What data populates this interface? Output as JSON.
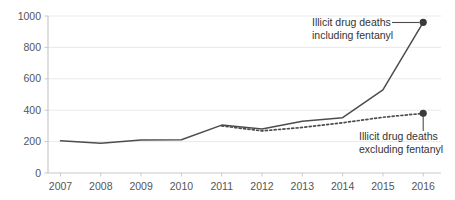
{
  "chart_data": {
    "type": "line",
    "title": "",
    "subtitle": "",
    "xlabel": "",
    "ylabel": "",
    "categories": [
      "2007",
      "2008",
      "2009",
      "2010",
      "2011",
      "2012",
      "2013",
      "2014",
      "2015",
      "2016"
    ],
    "x": [
      2007,
      2008,
      2009,
      2010,
      2011,
      2012,
      2013,
      2014,
      2015,
      2016
    ],
    "xlim": [
      2007,
      2016
    ],
    "ylim": [
      0,
      1000
    ],
    "yticks": [
      0,
      200,
      400,
      600,
      800,
      1000
    ],
    "ytick_labels": [
      "0",
      "200",
      "400",
      "600",
      "800",
      "1000"
    ],
    "xtick_labels": [
      "2007",
      "2008",
      "2009",
      "2010",
      "2011",
      "2012",
      "2013",
      "2014",
      "2015",
      "2016"
    ],
    "grid": true,
    "grid_axis": "y",
    "legend": "annotations",
    "series": [
      {
        "name": "Illicit drug deaths including fentanyl",
        "style": "solid",
        "color": "#4d4d4d",
        "values": [
          205,
          190,
          210,
          212,
          305,
          280,
          330,
          352,
          530,
          960
        ],
        "endpoint_marker": true
      },
      {
        "name": "Illicit drug deaths excluding fentanyl",
        "style": "dotted",
        "color": "#4d4d4d",
        "values": [
          null,
          null,
          null,
          null,
          300,
          268,
          290,
          320,
          355,
          380
        ],
        "endpoint_marker": true
      }
    ],
    "annotations": [
      {
        "id": "annotation-including-fentanyl",
        "line1": "Illicit drug deaths",
        "line2": "including fentanyl",
        "points_to": {
          "x": 2016,
          "y": 960
        }
      },
      {
        "id": "annotation-excluding-fentanyl",
        "line1": "Illicit drug deaths",
        "line2": "excluding fentanyl",
        "points_to": {
          "x": 2016,
          "y": 380
        }
      }
    ],
    "colors": {
      "line": "#4d4d4d",
      "marker": "#3a3a3a",
      "grid": "#e9e9e9",
      "axis": "#c9c9c9",
      "text": "#555555",
      "background": "#ffffff"
    }
  }
}
